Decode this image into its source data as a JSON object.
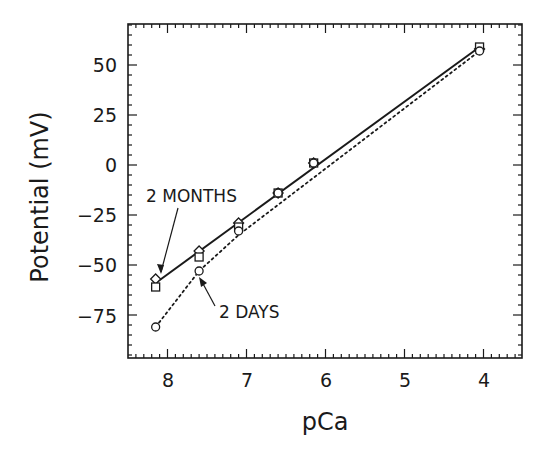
{
  "chart_data": {
    "type": "line",
    "title": "",
    "xlabel": "pCa",
    "ylabel": "Potential (mV)",
    "xlim": [
      8.5,
      3.5
    ],
    "ylim": [
      -90,
      72
    ],
    "x_reversed": true,
    "grid": false,
    "xticks": [
      8,
      7,
      6,
      5,
      4
    ],
    "xtick_labels": [
      "8",
      "7",
      "6",
      "5",
      "4"
    ],
    "yticks": [
      50,
      25,
      0,
      -25,
      -50,
      -75
    ],
    "ytick_labels": [
      "50",
      "25",
      "0",
      "-25",
      "-50",
      "-75"
    ],
    "series": [
      {
        "name": "2 MONTHS (diamonds)",
        "marker": "diamond",
        "line": "solid",
        "x": [
          8.15,
          7.6,
          7.1,
          6.6,
          6.15,
          4.05
        ],
        "y": [
          -57,
          -43,
          -29,
          -14,
          1,
          58
        ]
      },
      {
        "name": "2 MONTHS (squares)",
        "marker": "square",
        "line": "none",
        "x": [
          8.15,
          7.6,
          7.1,
          6.6,
          6.15,
          4.05
        ],
        "y": [
          -61,
          -46,
          -31,
          -14,
          1,
          59
        ]
      },
      {
        "name": "2 DAYS",
        "marker": "circle",
        "line": "dotted",
        "x": [
          8.15,
          7.6,
          7.1,
          6.6,
          6.15,
          4.05
        ],
        "y": [
          -81,
          -53,
          -33,
          -14,
          1,
          57
        ]
      }
    ],
    "fit_lines": [
      {
        "name": "2 MONTHS fit",
        "style": "solid",
        "x": [
          8.15,
          4.05
        ],
        "y": [
          -59,
          59
        ]
      },
      {
        "name": "2 DAYS fit",
        "style": "dotted",
        "x": [
          8.15,
          7.6,
          7.1,
          4.05
        ],
        "y": [
          -81,
          -53,
          -35,
          57
        ]
      }
    ],
    "annotations": [
      {
        "text": "2 MONTHS",
        "points_to": {
          "x": 8.15,
          "y": -57
        }
      },
      {
        "text": "2 DAYS",
        "points_to": {
          "x": 7.6,
          "y": -53
        }
      }
    ]
  },
  "labels": {
    "xlabel": "pCa",
    "ylabel": "Potential (mV)",
    "annot_months": "2 MONTHS",
    "annot_days": "2 DAYS",
    "x8": "8",
    "x7": "7",
    "x6": "6",
    "x5": "5",
    "x4": "4",
    "y50": "50",
    "y25": "25",
    "y0": "0",
    "ym25": "−25",
    "ym50": "−50",
    "ym75": "−75"
  }
}
